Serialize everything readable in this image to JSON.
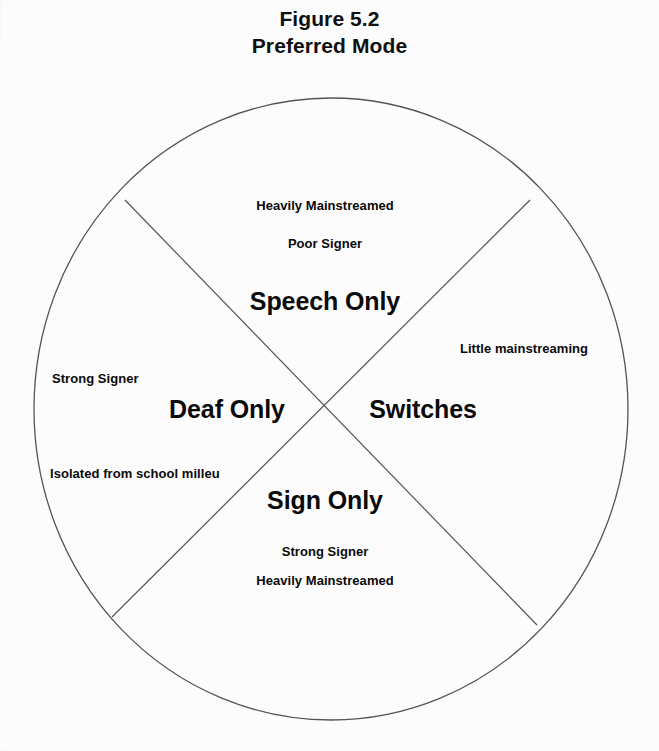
{
  "figure": {
    "title_lines": [
      "Figure 5.2",
      "Preferred Mode"
    ],
    "title_number": "Figure 5.2",
    "title_name": "Preferred Mode"
  },
  "diagram": {
    "shape": "circle-divided-into-four-quadrants-by-an-X",
    "stroke_color": "#555555",
    "background_color": "#fcfcfc",
    "text_color": "#0a0a0a",
    "circle": {
      "cx": 331,
      "cy": 409,
      "rx": 297,
      "ry": 311
    },
    "divider_lines": [
      {
        "name": "diagonal-nw-se",
        "x1": 125,
        "y1": 200,
        "x2": 537,
        "y2": 625
      },
      {
        "name": "diagonal-ne-sw",
        "x1": 530,
        "y1": 200,
        "x2": 112,
        "y2": 617
      }
    ]
  },
  "quadrants": [
    {
      "id": "top",
      "label": "Speech Only",
      "descriptors": [
        "Heavily Mainstreamed",
        "Poor Signer"
      ]
    },
    {
      "id": "right",
      "label": "Switches",
      "descriptors": [
        "Little mainstreaming"
      ]
    },
    {
      "id": "bottom",
      "label": "Sign Only",
      "descriptors": [
        "Strong Signer",
        "Heavily Mainstreamed"
      ]
    },
    {
      "id": "left",
      "label": "Deaf Only",
      "descriptors": [
        "Strong Signer",
        "Isolated from school milleu"
      ]
    }
  ],
  "labels": {
    "top_descriptor_1": "Heavily Mainstreamed",
    "top_descriptor_2": "Poor Signer",
    "top_major": "Speech Only",
    "right_descriptor_1": "Little mainstreaming",
    "right_major": "Switches",
    "left_major": "Deaf Only",
    "left_descriptor_1": "Strong Signer",
    "left_descriptor_2": "Isolated from school milleu",
    "bottom_major": "Sign Only",
    "bottom_descriptor_1": "Strong Signer",
    "bottom_descriptor_2": "Heavily Mainstreamed"
  }
}
